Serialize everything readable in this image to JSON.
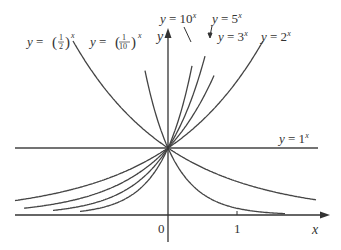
{
  "figure": {
    "axes": {
      "x_label": "x",
      "y_label": "y",
      "origin_label": "0",
      "x_tick_label": "1"
    },
    "curves": [
      {
        "name": "y = 10^x",
        "base": 10,
        "label_text": "y = 10",
        "sup": "x"
      },
      {
        "name": "y = 5^x",
        "base": 5,
        "label_text": "y = 5",
        "sup": "x"
      },
      {
        "name": "y = 3^x",
        "base": 3,
        "label_text": "y = 3",
        "sup": "x"
      },
      {
        "name": "y = 2^x",
        "base": 2,
        "label_text": "y = 2",
        "sup": "x"
      },
      {
        "name": "y = 1^x",
        "base": 1,
        "label_text": "y = 1",
        "sup": "x"
      },
      {
        "name": "y = (1/2)^x",
        "base": 0.5,
        "label_text": "y =",
        "frac_num": "1",
        "frac_den": "2",
        "sup": "x"
      },
      {
        "name": "y = (1/10)^x",
        "base": 0.1,
        "label_text": "y =",
        "frac_num": "1",
        "frac_den": "10",
        "sup": "x"
      }
    ],
    "colors": {
      "line": "#444444",
      "text": "#333333",
      "background": "#ffffff"
    }
  }
}
